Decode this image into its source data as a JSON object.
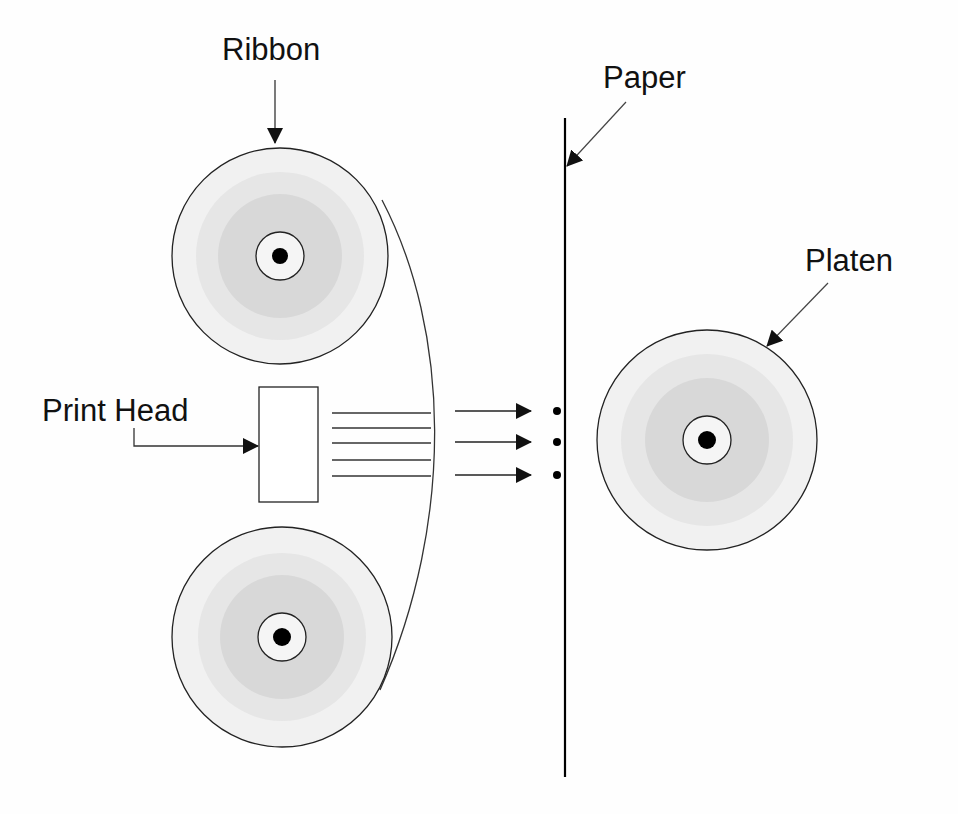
{
  "diagram": {
    "labels": {
      "ribbon": "Ribbon",
      "paper": "Paper",
      "platen": "Platen",
      "print_head": "Print Head"
    },
    "components": [
      {
        "name": "ribbon-reel-top",
        "type": "reel"
      },
      {
        "name": "ribbon-reel-bottom",
        "type": "reel"
      },
      {
        "name": "ribbon-strand",
        "type": "curve"
      },
      {
        "name": "print-head",
        "type": "rectangle"
      },
      {
        "name": "print-wires",
        "type": "lines",
        "count": 5
      },
      {
        "name": "impact-arrows",
        "type": "arrows",
        "count": 3
      },
      {
        "name": "print-dots",
        "type": "dots",
        "count": 3
      },
      {
        "name": "paper-sheet",
        "type": "vertical-line"
      },
      {
        "name": "platen-roller",
        "type": "reel"
      }
    ],
    "colors": {
      "reel_outer": "#f1f1f1",
      "reel_mid": "#e3e3e3",
      "reel_inner": "#d6d6d6",
      "hub": "#f4f4f4",
      "axle": "#000000",
      "stroke": "#222222"
    }
  }
}
